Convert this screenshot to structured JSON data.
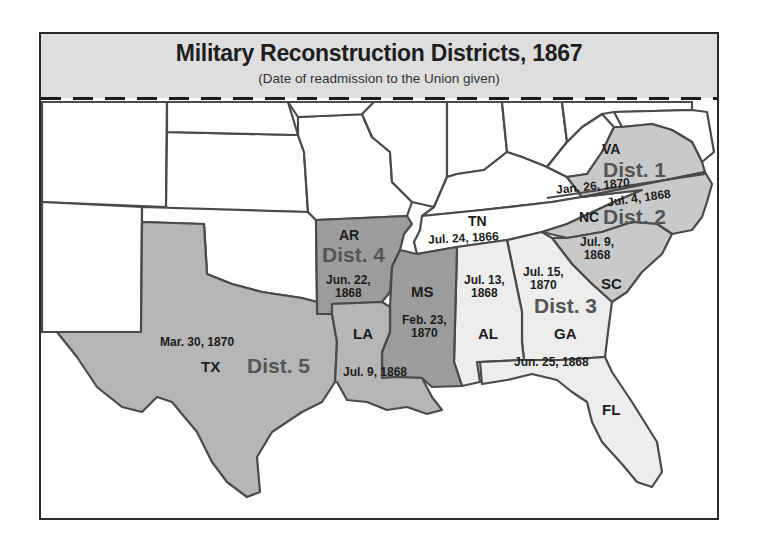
{
  "header": {
    "title": "Military Reconstruction Districts, 1867",
    "subtitle": "(Date of readmission to the Union given)"
  },
  "colors": {
    "header_bg": "#dedede",
    "district_1_2": "#c9c9c9",
    "district_3": "#ededed",
    "district_4": "#9c9c9c",
    "district_5": "#b6b6b6",
    "non_confederate": "#ffffff",
    "border": "#4a4a4a"
  },
  "districts": [
    {
      "id": "dist1",
      "label": "Dist. 1",
      "states": [
        "VA"
      ]
    },
    {
      "id": "dist2",
      "label": "Dist. 2",
      "states": [
        "NC",
        "SC"
      ]
    },
    {
      "id": "dist3",
      "label": "Dist. 3",
      "states": [
        "GA",
        "AL",
        "FL"
      ]
    },
    {
      "id": "dist4",
      "label": "Dist. 4",
      "states": [
        "AR",
        "MS"
      ]
    },
    {
      "id": "dist5",
      "label": "Dist. 5",
      "states": [
        "TX",
        "LA"
      ]
    }
  ],
  "states": {
    "VA": {
      "abbr": "VA",
      "date": "Jan. 26, 1870"
    },
    "NC": {
      "abbr": "NC",
      "date": "Jul. 4, 1868"
    },
    "SC": {
      "abbr": "SC",
      "date": "Jul. 9, 1868"
    },
    "GA": {
      "abbr": "GA",
      "date": "Jul. 15, 1870"
    },
    "AL": {
      "abbr": "AL",
      "date": "Jul. 13, 1868"
    },
    "FL": {
      "abbr": "FL",
      "date": "Jun. 25, 1868"
    },
    "AR": {
      "abbr": "AR",
      "date": "Jun. 22, 1868"
    },
    "MS": {
      "abbr": "MS",
      "date": "Feb. 23, 1870"
    },
    "LA": {
      "abbr": "LA",
      "date": "Jul. 9, 1868"
    },
    "TX": {
      "abbr": "TX",
      "date": "Mar. 30, 1870"
    },
    "TN": {
      "abbr": "TN",
      "date": "Jul. 24, 1866"
    }
  },
  "date_lines": {
    "SC": [
      "Jul. 9,",
      "1868"
    ],
    "GA": [
      "Jul. 15,",
      "1870"
    ],
    "AL": [
      "Jul. 13,",
      "1868"
    ],
    "AR": [
      "Jun. 22,",
      "1868"
    ],
    "MS": [
      "Feb. 23,",
      "1870"
    ]
  }
}
